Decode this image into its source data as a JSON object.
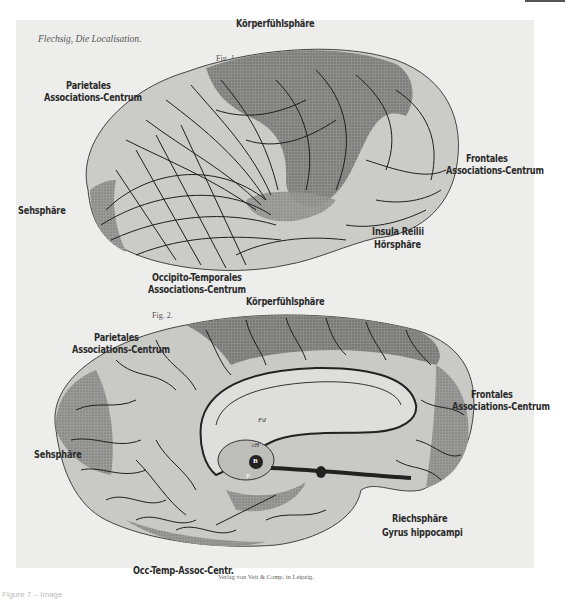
{
  "plate": {
    "header": "Flechsig, Die Localisation.",
    "publisher": "Verlag von Veit & Comp. in Leipzig.",
    "footer_caption": "Figure 7 – Image"
  },
  "fig1": {
    "label": "Fig. 1.",
    "view": "lateral",
    "annotations": [
      {
        "id": "koerperfuehlsphaere",
        "text": "Körperfühlsphäre"
      },
      {
        "id": "parietales-1",
        "text": "Parietales"
      },
      {
        "id": "parietales-2",
        "text": "Associations-Centrum"
      },
      {
        "id": "frontales-1",
        "text": "Frontales"
      },
      {
        "id": "frontales-2",
        "text": "Associations-Centrum"
      },
      {
        "id": "sehsphaere",
        "text": "Sehsphäre"
      },
      {
        "id": "insula",
        "text": "Insula Reilii"
      },
      {
        "id": "hoersphaere",
        "text": "Hörsphäre"
      },
      {
        "id": "occipito-1",
        "text": "Occipito-Temporales"
      },
      {
        "id": "occipito-2",
        "text": "Associations-Centrum"
      }
    ]
  },
  "fig2": {
    "label": "Fig. 2.",
    "view": "medial",
    "annotations": [
      {
        "id": "koerperfuehlsphaere",
        "text": "Körperfühlsphäre"
      },
      {
        "id": "parietales-1",
        "text": "Parietales"
      },
      {
        "id": "parietales-2",
        "text": "Associations-Centrum"
      },
      {
        "id": "frontales-1",
        "text": "Frontales"
      },
      {
        "id": "frontales-2",
        "text": "Associations-Centrum"
      },
      {
        "id": "sehsphaere",
        "text": "Sehsphäre"
      },
      {
        "id": "riechsphaere",
        "text": "Riechsphäre"
      },
      {
        "id": "gyrus",
        "text": "Gyrus hippocampi"
      },
      {
        "id": "occ-temp",
        "text": "Occ-Temp-Assoc-Centr."
      }
    ],
    "internal_marks": [
      "Fd",
      "cH",
      "B",
      "P"
    ]
  },
  "colors": {
    "background": "#ededeb",
    "cortex_light": "#c9c9c6",
    "cortex_dark": "#7a7a78",
    "sulci": "#1e1e1e",
    "label_text": "#2a2a2a"
  }
}
